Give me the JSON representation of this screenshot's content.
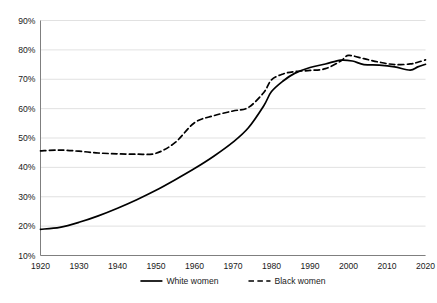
{
  "chart_data": {
    "type": "line",
    "title": "",
    "subtitle": "",
    "xlabel": "",
    "ylabel": "",
    "xlim": [
      1920,
      2020
    ],
    "ylim": [
      10,
      90
    ],
    "grid": "horizontal",
    "legend_position": "bottom-center",
    "x_tick_labels": [
      "1920",
      "1930",
      "1940",
      "1950",
      "1960",
      "1970",
      "1980",
      "1990",
      "2000",
      "2010",
      "2020"
    ],
    "x_ticks": [
      1920,
      1930,
      1940,
      1950,
      1960,
      1970,
      1980,
      1990,
      2000,
      2010,
      2020
    ],
    "y_tick_labels": [
      "10%",
      "20%",
      "30%",
      "40%",
      "50%",
      "60%",
      "70%",
      "80%",
      "90%"
    ],
    "y_ticks": [
      10,
      20,
      30,
      40,
      50,
      60,
      70,
      80,
      90
    ],
    "series": [
      {
        "name": "White women",
        "style": "solid",
        "color": "#000000",
        "x": [
          1920,
          1925,
          1930,
          1935,
          1940,
          1945,
          1950,
          1955,
          1960,
          1965,
          1970,
          1974,
          1978,
          1980,
          1983,
          1986,
          1990,
          1994,
          1998,
          2001,
          2004,
          2008,
          2012,
          2016,
          2018,
          2020
        ],
        "values": [
          18.9,
          19.6,
          21.3,
          23.5,
          26.1,
          29.0,
          32.2,
          35.8,
          39.6,
          43.8,
          48.6,
          53.5,
          61.0,
          65.8,
          69.4,
          72.0,
          74.0,
          75.2,
          76.5,
          76.2,
          75.0,
          74.8,
          74.2,
          73.1,
          74.2,
          75.1
        ]
      },
      {
        "name": "Black women",
        "style": "dashed",
        "color": "#000000",
        "x": [
          1920,
          1925,
          1930,
          1935,
          1940,
          1945,
          1950,
          1955,
          1960,
          1965,
          1970,
          1974,
          1978,
          1980,
          1983,
          1986,
          1990,
          1994,
          1998,
          2000,
          2004,
          2008,
          2012,
          2016,
          2018,
          2020
        ],
        "values": [
          45.6,
          45.9,
          45.5,
          44.9,
          44.6,
          44.5,
          44.8,
          48.5,
          55.2,
          57.6,
          59.2,
          60.4,
          65.5,
          69.8,
          71.8,
          72.6,
          73.0,
          73.6,
          76.2,
          78.1,
          77.0,
          75.8,
          75.0,
          75.2,
          75.8,
          76.6
        ]
      }
    ],
    "legend": [
      {
        "label": "White women",
        "style": "solid"
      },
      {
        "label": "Black women",
        "style": "dashed"
      }
    ]
  }
}
